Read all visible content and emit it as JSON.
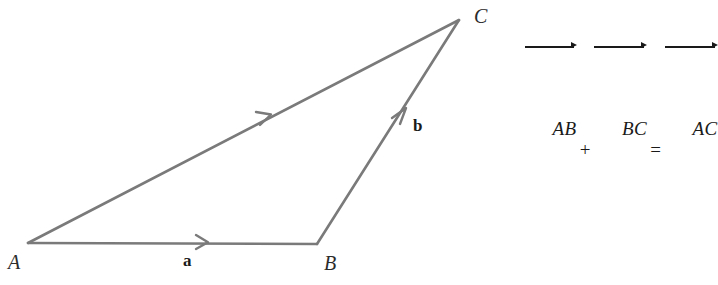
{
  "figure": {
    "name": "vector-addition-triangle",
    "background_color": "#ffffff",
    "stroke_color": "#7a7a7a",
    "text_color": "#1a1a1a",
    "vertex_label_color": "#2b2b2b"
  },
  "diagram": {
    "vertices": [
      {
        "id": "A",
        "label": "A",
        "x": 28,
        "y": 243
      },
      {
        "id": "B",
        "label": "B",
        "x": 317,
        "y": 244
      },
      {
        "id": "C",
        "label": "C",
        "x": 459,
        "y": 20
      }
    ],
    "edges": [
      {
        "id": "AB",
        "from": "A",
        "to": "B",
        "arrow_at_x": 205,
        "arrow_at_y": 242,
        "vector_label": "a"
      },
      {
        "id": "BC",
        "from": "B",
        "to": "C",
        "arrow_at_x": 403,
        "arrow_at_y": 115,
        "vector_label": "b"
      },
      {
        "id": "AC",
        "from": "A",
        "to": "C",
        "arrow_at_x": 267,
        "arrow_at_y": 117,
        "vector_label": ""
      }
    ],
    "vector_labels": [
      {
        "id": "a",
        "label": "a",
        "x": 183,
        "y": 252
      },
      {
        "id": "b",
        "label": "b",
        "x": 413,
        "y": 117
      }
    ]
  },
  "equation": {
    "full_text": "AB + BC = AC",
    "terms": [
      {
        "id": "term-ab",
        "letters": "AB",
        "notation": "overrightarrow"
      },
      {
        "id": "term-bc",
        "letters": "BC",
        "notation": "overrightarrow"
      },
      {
        "id": "term-ac",
        "letters": "AC",
        "notation": "overrightarrow"
      }
    ],
    "operators": {
      "plus": "+",
      "equals": "="
    }
  }
}
